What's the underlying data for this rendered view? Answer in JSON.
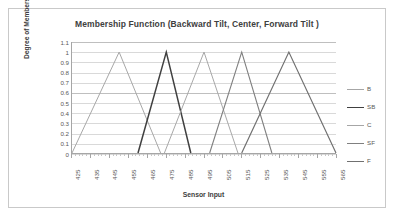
{
  "chart_data": {
    "type": "line",
    "title": "Membership Function (Backward Tilt, Center, Forward Tilt )",
    "xlabel": "Sensor Input",
    "ylabel": "Degree of Membership",
    "xlim": [
      425,
      565
    ],
    "ylim": [
      0,
      1.1
    ],
    "grid": true,
    "legend_position": "right",
    "x_ticks": [
      425,
      435,
      445,
      455,
      465,
      475,
      485,
      495,
      505,
      515,
      525,
      535,
      545,
      555,
      565
    ],
    "y_ticks": [
      "0",
      "0.1",
      "0.2",
      "0.3",
      "0.4",
      "0.5",
      "0.6",
      "0.7",
      "0.8",
      "0.9",
      "1",
      "1.1"
    ],
    "series": [
      {
        "name": "B",
        "color": "#a6a6a6",
        "width": 1.0,
        "points": [
          [
            425,
            0
          ],
          [
            450,
            1
          ],
          [
            472,
            0
          ]
        ]
      },
      {
        "name": "SB",
        "color": "#404040",
        "width": 1.5,
        "points": [
          [
            460,
            0
          ],
          [
            475,
            1
          ],
          [
            488,
            0
          ]
        ]
      },
      {
        "name": "C",
        "color": "#a6a6a6",
        "width": 1.0,
        "points": [
          [
            474,
            0
          ],
          [
            495,
            1
          ],
          [
            513,
            0
          ]
        ]
      },
      {
        "name": "SF",
        "color": "#808080",
        "width": 1.1,
        "points": [
          [
            498,
            0
          ],
          [
            515,
            1
          ],
          [
            531,
            0
          ]
        ]
      },
      {
        "name": "F",
        "color": "#707070",
        "width": 1.2,
        "points": [
          [
            515,
            0
          ],
          [
            540,
            1
          ],
          [
            565,
            0
          ]
        ]
      }
    ]
  },
  "legend": {
    "entries": [
      {
        "label": "B",
        "color": "#a6a6a6",
        "width": 1.0
      },
      {
        "label": "SB",
        "color": "#404040",
        "width": 1.6
      },
      {
        "label": "C",
        "color": "#a6a6a6",
        "width": 1.0
      },
      {
        "label": "SF",
        "color": "#808080",
        "width": 1.2
      },
      {
        "label": "F",
        "color": "#707070",
        "width": 1.3
      }
    ]
  }
}
